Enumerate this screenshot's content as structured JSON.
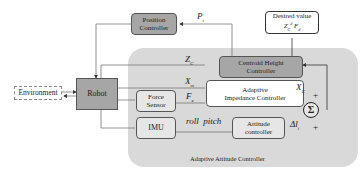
{
  "diagram": {
    "title": "Adaptive Attitude Controller",
    "colors": {
      "panel": "#d9d9d9",
      "controller_fill": "#a6a6a6",
      "robot_fill": "#a6a6a6",
      "inner_box_fill": "#e6e6e6",
      "white_box_fill": "#ffffff",
      "line": "#888888"
    },
    "blocks": {
      "environment": "Environment",
      "robot": "Robot",
      "position_controller_l1": "Position",
      "position_controller_l2": "Controller",
      "desired_value_l1": "Desired value",
      "desired_value_z": "Z",
      "desired_value_z_sub": "C",
      "desired_value_z_sup": "d",
      "desired_value_f": "F",
      "desired_value_f_sub": "d",
      "centroid_height_l1": "Centroid Height",
      "centroid_height_l2": "Controller",
      "adaptive_impedance_l1": "Adaptive",
      "adaptive_impedance_l2": "Impedance Controller",
      "force_sensor_l1": "Force",
      "force_sensor_l2": "Sensor",
      "imu": "IMU",
      "attitude_l1": "Attitude",
      "attitude_l2": "controller",
      "sum": "Σ"
    },
    "signals": {
      "p": "P",
      "p_sub": "i",
      "zc": "Z",
      "zc_sub": "C",
      "xm": "X",
      "xm_sub": "m",
      "fe": "F",
      "fe_sub": "e",
      "xc": "X",
      "xc_sub": "C",
      "dl": "Δl",
      "dl_sub": "i",
      "roll_pitch": "roll  pitch",
      "plus1": "+",
      "plus2": "+"
    }
  }
}
